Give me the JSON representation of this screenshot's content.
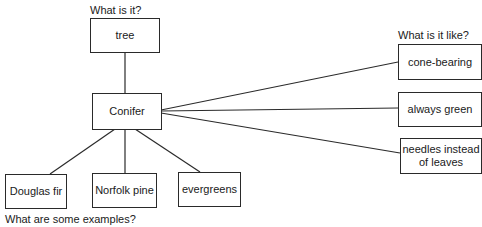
{
  "diagram": {
    "questions": {
      "what_is_it": "What is it?",
      "what_is_it_like": "What is it like?",
      "examples": "What are some examples?"
    },
    "center": "Conifer",
    "category": "tree",
    "properties": [
      "cone-bearing",
      "always green",
      "needles instead of leaves"
    ],
    "examples": [
      "Douglas fir",
      "Norfolk pine",
      "evergreens"
    ]
  }
}
